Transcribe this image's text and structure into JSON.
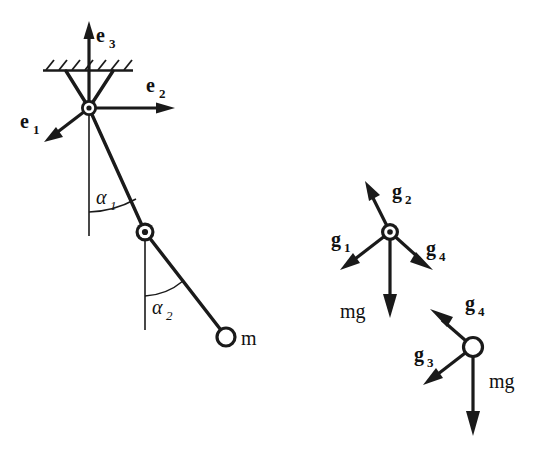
{
  "figure": {
    "background_color": "#ffffff",
    "ink_color": "#1a1a1a"
  },
  "left_diagram": {
    "name": "double-pendulum-schematic",
    "support": {
      "type": "hatched-ceiling",
      "hatch_stroke_count": 7
    },
    "basis_vectors": [
      {
        "id": "e1",
        "label": "e",
        "subscript": "1",
        "direction": "down-left"
      },
      {
        "id": "e2",
        "label": "e",
        "subscript": "2",
        "direction": "right"
      },
      {
        "id": "e3",
        "label": "e",
        "subscript": "3",
        "direction": "up"
      }
    ],
    "angles": [
      {
        "id": "alpha1",
        "label": "α",
        "subscript": "1"
      },
      {
        "id": "alpha2",
        "label": "α",
        "subscript": "2"
      }
    ],
    "mass_label": "m",
    "joints": [
      {
        "id": "pivot",
        "style": "ringed-pivot"
      },
      {
        "id": "elbow",
        "style": "ringed-pivot"
      },
      {
        "id": "bob",
        "style": "hollow-circle"
      }
    ]
  },
  "right_diagram": {
    "name": "free-body-force-diagram",
    "upper_node": {
      "style": "ringed-pivot",
      "forces": [
        {
          "id": "g1",
          "label": "g",
          "subscript": "1",
          "direction": "down-left"
        },
        {
          "id": "g2",
          "label": "g",
          "subscript": "2",
          "direction": "up-left-tilt"
        },
        {
          "id": "g4",
          "label": "g",
          "subscript": "4",
          "direction": "down-right"
        },
        {
          "id": "mg_upper",
          "label": "mg",
          "subscript": "",
          "direction": "down"
        }
      ]
    },
    "lower_node": {
      "style": "hollow-circle",
      "forces": [
        {
          "id": "g4b",
          "label": "g",
          "subscript": "4",
          "direction": "up-left"
        },
        {
          "id": "g3",
          "label": "g",
          "subscript": "3",
          "direction": "down-left"
        },
        {
          "id": "mg_lower",
          "label": "mg",
          "subscript": "",
          "direction": "down"
        }
      ]
    }
  }
}
